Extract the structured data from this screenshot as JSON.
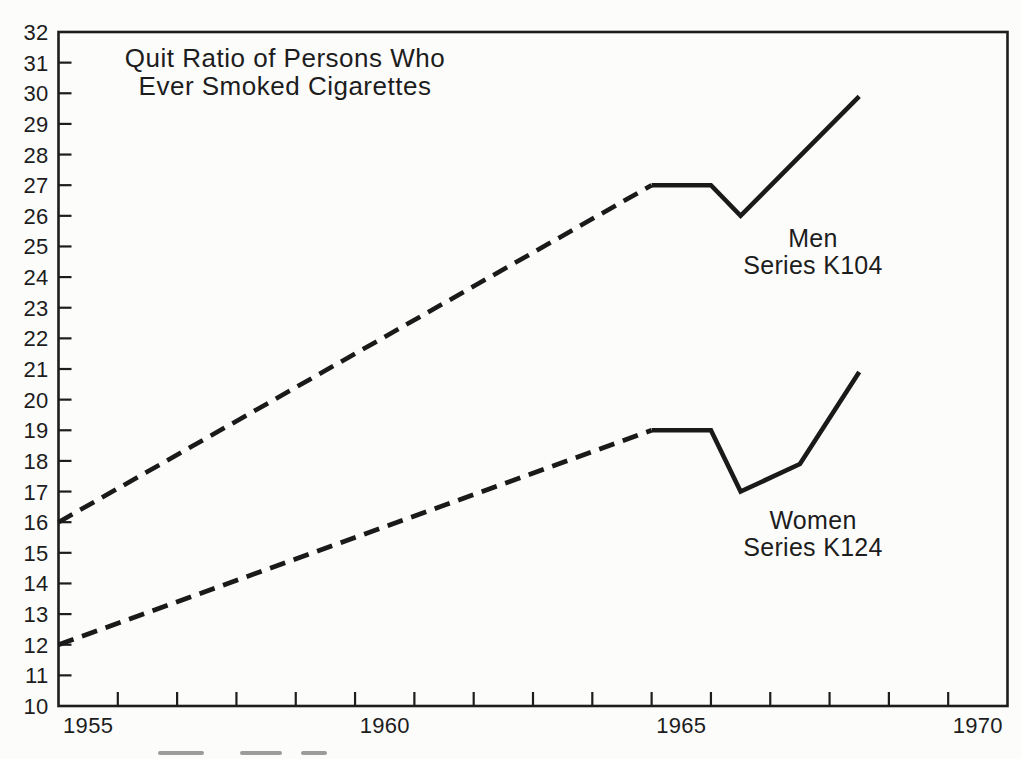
{
  "page": {
    "background_color": "#fcfcfb",
    "ink_color": "#1d1d1d"
  },
  "chart_data": {
    "type": "line",
    "title_lines": [
      "Quit Ratio of Persons Who",
      "Ever Smoked Cigarettes"
    ],
    "grid": "off",
    "legend_position": "inline-annotations",
    "x_axis": {
      "range": [
        1954.5,
        1970.5
      ],
      "tick_start": 1955.5,
      "tick_step": 1,
      "tick_end": 1969.5,
      "tick_labels": [
        {
          "text": "1955",
          "year": 1955
        },
        {
          "text": "1960",
          "year": 1960
        },
        {
          "text": "1965",
          "year": 1965
        },
        {
          "text": "1970",
          "year": 1970
        }
      ]
    },
    "y_axis": {
      "range": [
        10,
        32
      ],
      "tick_step": 1,
      "tick_labels": [
        32,
        31,
        30,
        29,
        28,
        27,
        26,
        25,
        24,
        23,
        22,
        21,
        20,
        19,
        18,
        17,
        16,
        15,
        14,
        13,
        12,
        11,
        10
      ]
    },
    "series": [
      {
        "name": "Men",
        "annotation_lines": [
          "Men",
          "Series K104"
        ],
        "line_color": "#1a1a1a",
        "dashed_points": [
          [
            1954.5,
            16
          ],
          [
            1964.5,
            27
          ]
        ],
        "solid_points": [
          [
            1964.5,
            27
          ],
          [
            1965.5,
            27
          ],
          [
            1966,
            26
          ],
          [
            1968,
            29.9
          ]
        ]
      },
      {
        "name": "Women",
        "annotation_lines": [
          "Women",
          "Series K124"
        ],
        "line_color": "#1a1a1a",
        "dashed_points": [
          [
            1954.5,
            12
          ],
          [
            1964.5,
            19
          ]
        ],
        "solid_points": [
          [
            1964.5,
            19
          ],
          [
            1965.5,
            19
          ],
          [
            1966,
            17
          ],
          [
            1967,
            17.9
          ],
          [
            1968,
            20.9
          ]
        ]
      }
    ]
  }
}
